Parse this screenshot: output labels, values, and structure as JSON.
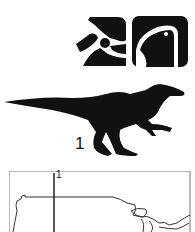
{
  "figure": {
    "icons": [
      {
        "name": "dinosaur-skull-crest-icon"
      },
      {
        "name": "dinosaur-head-profile-icon"
      }
    ],
    "silhouette": {
      "name": "theropod-dinosaur-silhouette",
      "label": "1"
    },
    "map": {
      "name": "north-america-map",
      "marker_label": "1"
    },
    "colors": {
      "ink": "#111111",
      "background": "#ffffff",
      "map_line": "#333333"
    }
  }
}
